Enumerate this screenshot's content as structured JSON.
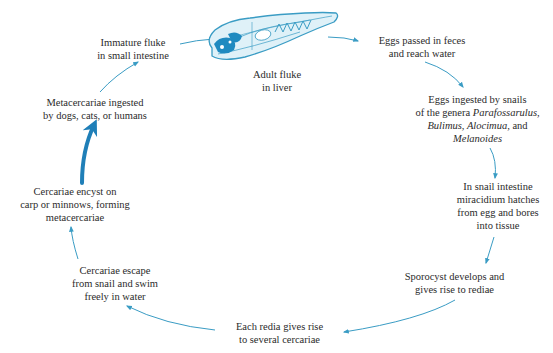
{
  "diagram": {
    "type": "life-cycle",
    "accent_color": "#3a9cc4",
    "dark_accent_color": "#1f7fb8",
    "center_image": {
      "icon": "adult-fluke-illustration",
      "caption_line1": "Adult fluke",
      "caption_line2": "in liver"
    },
    "stages": [
      {
        "id": "eggs-passed",
        "line1": "Eggs passed in feces",
        "line2": "and reach water"
      },
      {
        "id": "eggs-ingested-snails",
        "line1": "Eggs ingested by snails",
        "line2_prefix": "of the genera ",
        "line2_italic": "Parafossarulus,",
        "line3_italic_a": "Bulimus, Alocimua,",
        "line3_rest": " and",
        "line4_italic": "Melanoides"
      },
      {
        "id": "miracidium-hatches",
        "line1": "In snail intestine",
        "line2": "miracidium hatches",
        "line3": "from egg and bores",
        "line4": "into tissue"
      },
      {
        "id": "sporocyst",
        "line1": "Sporocyst develops and",
        "line2": "gives rise to rediae"
      },
      {
        "id": "redia",
        "line1": "Each redia gives rise",
        "line2": "to several cercariae"
      },
      {
        "id": "cercariae-escape",
        "line1": "Cercariae escape",
        "line2": "from snail and swim",
        "line3": "freely in water"
      },
      {
        "id": "cercariae-encyst",
        "line1": "Cercariae encyst on",
        "line2": "carp or minnows, forming",
        "line3": "metacercariae"
      },
      {
        "id": "metacercariae-ingested",
        "line1": "Metacercariae ingested",
        "line2": "by dogs, cats, or humans"
      },
      {
        "id": "immature-fluke",
        "line1": "Immature fluke",
        "line2": "in small intestine"
      }
    ]
  }
}
